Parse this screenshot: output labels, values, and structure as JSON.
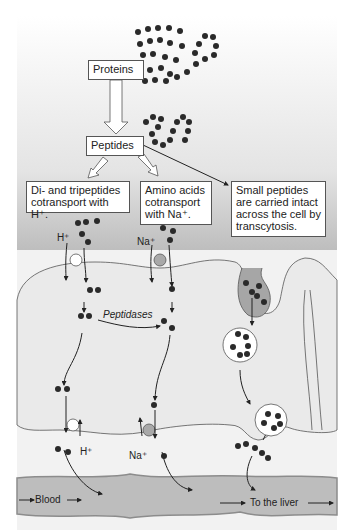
{
  "diagram": {
    "title_boxes": {
      "proteins": "Proteins",
      "peptides": "Peptides"
    },
    "pathways": [
      {
        "id": "di-tri",
        "label_line1": "Di- and tripeptides",
        "label_line2": "cotransport with H⁺."
      },
      {
        "id": "amino",
        "label_line1": "Amino acids",
        "label_line2": "cotransport",
        "label_line3": "with Na⁺."
      },
      {
        "id": "transcytosis",
        "label_line1": "Small peptides",
        "label_line2": "are carried intact",
        "label_line3": "across the cell by",
        "label_line4": "transcytosis."
      }
    ],
    "ions": {
      "h_apical": "H⁺",
      "na_apical": "Na⁺",
      "h_basal": "H⁺",
      "na_basal": "Na⁺"
    },
    "enzyme_label": "Peptidases",
    "blood_labels": {
      "blood": "Blood",
      "liver": "To the liver"
    },
    "colors": {
      "lumen_top": "#ffffff",
      "lumen_bottom": "#a8a8a8",
      "cell": "#ececec",
      "interstitial": "#f4f4f4",
      "vessel": "#bdbdbd",
      "vessel_wall": "#8c8c8c",
      "bead": "#2a2a2a",
      "na_transporter": "#a9a9a9",
      "h_transporter": "#ffffff"
    }
  }
}
